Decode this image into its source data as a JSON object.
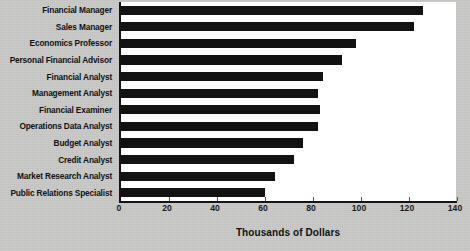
{
  "chart_data": {
    "type": "bar",
    "orientation": "horizontal",
    "title": "",
    "xlabel": "Thousands of Dollars",
    "ylabel": "",
    "xlim": [
      0,
      140
    ],
    "xticks": [
      0,
      20,
      40,
      60,
      80,
      100,
      120,
      140
    ],
    "grid": false,
    "legend": null,
    "bar_color": "#121212",
    "plot_background": "#ffffff",
    "figure_background": "#c9c9c7",
    "categories": [
      "Financial Manager",
      "Sales Manager",
      "Economics Professor",
      "Personal Financial Advisor",
      "Financial Analyst",
      "Management Analyst",
      "Financial Examiner",
      "Operations Data Analyst",
      "Budget Analyst",
      "Credit Analyst",
      "Market Research Analyst",
      "Public Relations Specialist"
    ],
    "values": [
      126,
      122,
      98,
      92,
      84,
      82,
      83,
      82,
      76,
      72,
      64,
      60
    ]
  }
}
